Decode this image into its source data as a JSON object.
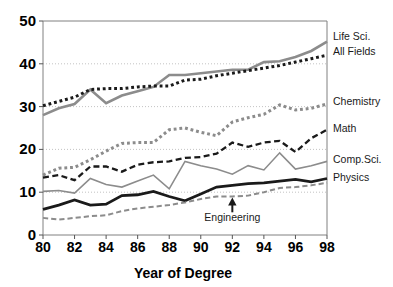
{
  "chart_data": {
    "type": "line",
    "title": "",
    "xlabel": "Year of Degree",
    "ylabel": "",
    "xlim": [
      80,
      98
    ],
    "ylim": [
      0,
      50
    ],
    "grid": true,
    "legend_position": "right-of-axes",
    "x": [
      80,
      81,
      82,
      83,
      84,
      85,
      86,
      87,
      88,
      89,
      90,
      91,
      92,
      93,
      94,
      95,
      96,
      97,
      98
    ],
    "xticks": [
      80,
      82,
      84,
      86,
      88,
      90,
      92,
      94,
      96,
      98
    ],
    "xtick_labels": [
      "80",
      "82",
      "84",
      "86",
      "88",
      "90",
      "92",
      "94",
      "96",
      "98"
    ],
    "yticks": [
      0,
      10,
      20,
      30,
      40,
      50
    ],
    "ytick_labels": [
      "0",
      "10",
      "20",
      "30",
      "40",
      "50"
    ],
    "series": [
      {
        "name": "Life Sci.",
        "label": "Life Sci.",
        "color": "#8c8c8c",
        "style": "solid",
        "width": 2.6,
        "label_y": 46.3,
        "values": [
          28.0,
          29.6,
          30.6,
          34.0,
          30.8,
          32.6,
          33.6,
          34.6,
          37.4,
          37.4,
          37.8,
          38.2,
          38.6,
          38.6,
          40.4,
          40.6,
          41.6,
          43.0,
          45.2
        ]
      },
      {
        "name": "All Fields",
        "label": "All Fields",
        "color": "#1a1a1a",
        "style": "dotted-square",
        "width": 3.0,
        "label_y": 42.6,
        "values": [
          30.2,
          31.2,
          32.2,
          34.0,
          34.2,
          34.2,
          34.6,
          34.8,
          34.8,
          36.2,
          36.4,
          37.2,
          37.8,
          38.4,
          39.0,
          39.6,
          40.4,
          41.2,
          42.0
        ]
      },
      {
        "name": "Chemistry",
        "label": "Chemistry",
        "color": "#8c8c8c",
        "style": "dotted-square",
        "width": 3.0,
        "label_y": 31.0,
        "values": [
          14.0,
          15.6,
          15.8,
          17.6,
          19.6,
          21.4,
          21.6,
          21.6,
          24.6,
          25.0,
          24.0,
          23.2,
          26.4,
          27.4,
          28.2,
          30.4,
          29.2,
          29.6,
          30.6
        ]
      },
      {
        "name": "Math",
        "label": "Math",
        "color": "#1a1a1a",
        "style": "dashed",
        "width": 2.3,
        "label_y": 24.8,
        "values": [
          13.4,
          14.0,
          12.8,
          16.0,
          16.0,
          14.8,
          16.4,
          17.0,
          17.2,
          18.0,
          18.2,
          19.0,
          21.6,
          20.6,
          21.6,
          22.0,
          19.4,
          22.6,
          24.6
        ]
      },
      {
        "name": "Comp.Sci.",
        "label": "Comp.Sci.",
        "color": "#8c8c8c",
        "style": "solid",
        "width": 1.6,
        "label_y": 17.4,
        "values": [
          10.2,
          10.4,
          9.8,
          13.2,
          11.8,
          11.2,
          12.6,
          14.0,
          10.8,
          17.2,
          16.2,
          15.4,
          14.2,
          16.2,
          15.2,
          19.2,
          15.4,
          16.2,
          17.2
        ]
      },
      {
        "name": "Physics",
        "label": "Physics",
        "color": "#1a1a1a",
        "style": "solid",
        "width": 2.8,
        "label_y": 13.2,
        "values": [
          6.0,
          7.0,
          8.2,
          7.0,
          7.2,
          9.2,
          9.4,
          10.2,
          9.0,
          8.0,
          9.6,
          11.2,
          11.6,
          12.0,
          12.2,
          12.6,
          13.0,
          12.4,
          13.2
        ]
      },
      {
        "name": "Engineering",
        "label": "Engineering",
        "color": "#8c8c8c",
        "style": "dashed",
        "width": 2.0,
        "label_y": null,
        "values": [
          4.0,
          3.6,
          4.0,
          4.4,
          4.6,
          5.6,
          6.2,
          6.6,
          7.0,
          7.6,
          8.4,
          9.0,
          9.0,
          9.2,
          10.0,
          11.0,
          11.2,
          11.6,
          12.2
        ]
      }
    ],
    "annotations": [
      {
        "text": "Engineering",
        "target_x": 92,
        "target_y": 9.0,
        "text_x": 92,
        "text_y": 3.2
      }
    ]
  },
  "axes": {
    "x_title": "Year of Degree"
  }
}
